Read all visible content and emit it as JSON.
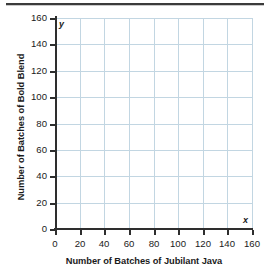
{
  "page": {
    "divider_label": "top-divider"
  },
  "chart_data": {
    "type": "scatter",
    "title": "",
    "subtitle": "",
    "xlabel": "Number of Batches of Jubilant Java",
    "ylabel": "Number of Batches of Bold Blend",
    "x_axis_letter": "x",
    "y_axis_letter": "y",
    "xlim": [
      0,
      160
    ],
    "ylim": [
      0,
      160
    ],
    "x_tick_step": 20,
    "y_tick_step": 20,
    "xticks": [
      0,
      20,
      40,
      60,
      80,
      100,
      120,
      140,
      160
    ],
    "yticks": [
      0,
      20,
      40,
      60,
      80,
      100,
      120,
      140,
      160
    ],
    "xtick_labels": [
      "0",
      "20",
      "40",
      "60",
      "80",
      "100",
      "120",
      "140",
      "160"
    ],
    "ytick_labels": [
      "0",
      "20",
      "40",
      "60",
      "80",
      "100",
      "120",
      "140",
      "160"
    ],
    "grid": true,
    "grid_color": "#c2d6e2",
    "axis_color": "#2e2e2e",
    "legend": false,
    "legend_position": "none",
    "series": [],
    "values": [],
    "annotations": [],
    "note": "Empty coordinate grid with no plotted data points"
  }
}
